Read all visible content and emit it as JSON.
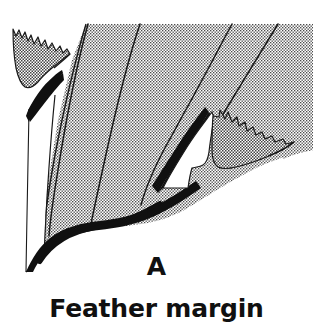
{
  "figure": {
    "panel_letter": "A",
    "caption": "Feather margin",
    "style": "black-and-white halftone line illustration"
  },
  "colors": {
    "background": "#ffffff",
    "ink": "#101010",
    "stipple_dot": "#3a3a3a",
    "stipple_base": "#ffffff",
    "hairline": "#1a1a1a"
  },
  "illustration": {
    "viewbox": "0 0 313 290",
    "parts": [
      {
        "id": "vane-band-1",
        "name": "vane-section-outer-left",
        "fill": "stipple",
        "description": "leftmost stippled vane band running from top edge down to lower-left"
      },
      {
        "id": "vane-band-2",
        "name": "vane-section-left-center",
        "fill": "stipple",
        "description": "second stippled vane band"
      },
      {
        "id": "vane-band-3",
        "name": "vane-section-center",
        "fill": "stipple",
        "description": "broad central stippled vane band"
      },
      {
        "id": "vane-band-4",
        "name": "vane-section-right-center",
        "fill": "stipple",
        "description": "fourth stippled vane band"
      },
      {
        "id": "vane-band-5",
        "name": "vane-section-outer-right",
        "fill": "stipple",
        "description": "rightmost stippled vane band at upper right corner"
      },
      {
        "id": "white-strip-left",
        "name": "unshaded-quill-strip",
        "fill": "white",
        "description": "narrow white unshaded strip along the far left, outlined by hairlines"
      },
      {
        "id": "white-notch-right",
        "name": "unshaded-notch-right",
        "fill": "white",
        "description": "white wavy-edged notch beside the right black wedge"
      },
      {
        "id": "barb-upper-left",
        "name": "serrated-barb-upper-left",
        "fill": "stipple",
        "description": "detached barb with sawtooth upper edge at upper left"
      },
      {
        "id": "barb-mid-right",
        "name": "serrated-barb-mid-right",
        "fill": "stipple",
        "description": "detached barb with sawtooth upper edge at mid right, tapering to a point"
      },
      {
        "id": "wedge-left",
        "name": "black-wedge-left",
        "fill": "solid-black",
        "description": "thick black tapering wedge under the upper-left barb"
      },
      {
        "id": "wedge-right",
        "name": "black-wedge-right",
        "fill": "solid-black",
        "description": "thick black tapering wedge under the mid-right barb"
      },
      {
        "id": "edge-bottom",
        "name": "thick-bottom-margin-edge",
        "fill": "solid-black",
        "description": "heavy black curved line forming the lower margin of the vane"
      }
    ],
    "divider_lines_top_x": [
      88,
      140,
      232,
      278
    ],
    "top_edge_y": 24
  }
}
